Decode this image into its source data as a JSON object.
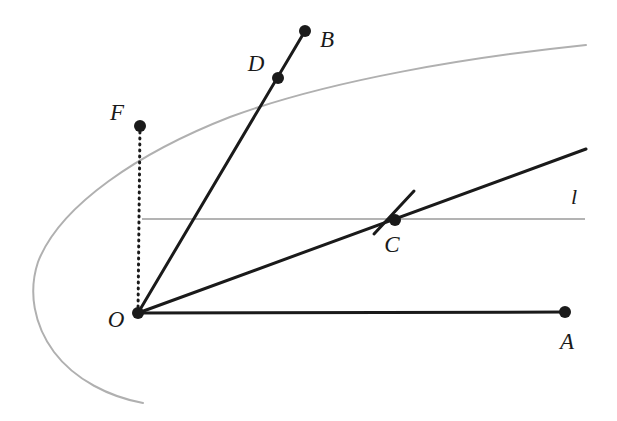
{
  "figure": {
    "width": 617,
    "height": 421,
    "background_color": "#ffffff"
  },
  "colors": {
    "curve": "#b0b0b0",
    "directrix_line": "#b3b3b3",
    "ray": "#1a1a1a",
    "dotted": "#1a1a1a",
    "point_fill": "#1a1a1a",
    "label_text": "#1a1a1a"
  },
  "labels": {
    "O": "O",
    "A": "A",
    "B": "B",
    "C": "C",
    "D": "D",
    "F": "F",
    "l": "l"
  },
  "points": [
    {
      "id": "O",
      "label": "O",
      "x": 138,
      "y": 313,
      "label_x": 116,
      "label_y": 322,
      "radius": 6
    },
    {
      "id": "A",
      "label": "A",
      "x": 565,
      "y": 312,
      "label_x": 567,
      "label_y": 344,
      "radius": 6
    },
    {
      "id": "B",
      "label": "B",
      "x": 305,
      "y": 31,
      "label_x": 327,
      "label_y": 42,
      "radius": 6
    },
    {
      "id": "C",
      "label": "C",
      "x": 395,
      "y": 220,
      "label_x": 392,
      "label_y": 247,
      "radius": 6
    },
    {
      "id": "D",
      "label": "D",
      "x": 278,
      "y": 78,
      "label_x": 256,
      "label_y": 66,
      "radius": 6
    },
    {
      "id": "F",
      "label": "F",
      "x": 140,
      "y": 126,
      "label_x": 117,
      "label_y": 115,
      "radius": 6
    }
  ],
  "curve": {
    "name": "parabola",
    "stroke": "#b0b0b0",
    "stroke_width": 2,
    "vertex": {
      "x": 34,
      "y": 285
    },
    "path": "M 586 45 C 470 57, 330 80, 230 117 C 140 152, 60 205, 38 262 C 28 292, 34 325, 54 352 C 75 380, 110 397, 143 403"
  },
  "directrix": {
    "name": "line-l",
    "label": "l",
    "stroke": "#b3b3b3",
    "stroke_width": 2,
    "x1": 142,
    "y1": 219,
    "x2": 585,
    "y2": 219,
    "label_x": 574,
    "label_y": 199
  },
  "segments": [
    {
      "id": "OA",
      "name": "segment-oa",
      "x1": 138,
      "y1": 313,
      "x2": 565,
      "y2": 312,
      "stroke": "#1a1a1a",
      "stroke_width": 3,
      "dash": "none"
    },
    {
      "id": "OCray",
      "name": "ray-o-through-c",
      "x1": 138,
      "y1": 313,
      "x2": 586,
      "y2": 149,
      "stroke": "#1a1a1a",
      "stroke_width": 3,
      "dash": "none"
    },
    {
      "id": "OB",
      "name": "segment-ob",
      "x1": 138,
      "y1": 313,
      "x2": 305,
      "y2": 31,
      "stroke": "#1a1a1a",
      "stroke_width": 3,
      "dash": "none"
    },
    {
      "id": "tangentC",
      "name": "tangent-at-c",
      "x1": 374,
      "y1": 234,
      "x2": 414,
      "y2": 191,
      "stroke": "#1a1a1a",
      "stroke_width": 3,
      "dash": "none"
    },
    {
      "id": "FO",
      "name": "dotted-segment-fo",
      "x1": 140,
      "y1": 126,
      "x2": 138,
      "y2": 313,
      "stroke": "#1a1a1a",
      "stroke_width": 3,
      "dash": "1 5"
    }
  ]
}
